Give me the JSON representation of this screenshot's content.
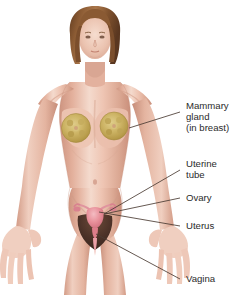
{
  "figure": {
    "background_color": "#ffffff",
    "width": 236,
    "height": 295,
    "text_color": "#2b2b2b",
    "leader_line_color": "#4a3b33"
  },
  "labels": [
    {
      "name": "mammary-gland",
      "lines": [
        "Mammary",
        "gland",
        "(in breast)"
      ],
      "text_x": 186,
      "text_y": 100,
      "leader": {
        "x1": 180,
        "y1": 112,
        "x2": 129,
        "y2": 128
      }
    },
    {
      "name": "uterine-tube",
      "lines": [
        "Uterine",
        "tube"
      ],
      "text_x": 186,
      "text_y": 158,
      "leader": {
        "x1": 180,
        "y1": 170,
        "x2": 104,
        "y2": 214
      }
    },
    {
      "name": "ovary",
      "lines": [
        "Ovary"
      ],
      "text_x": 186,
      "text_y": 194,
      "leader": {
        "x1": 180,
        "y1": 198,
        "x2": 104,
        "y2": 214
      }
    },
    {
      "name": "uterus",
      "lines": [
        "Uterus"
      ],
      "text_x": 186,
      "text_y": 222,
      "leader": {
        "x1": 180,
        "y1": 226,
        "x2": 99,
        "y2": 212
      }
    },
    {
      "name": "vagina",
      "lines": [
        "Vagina"
      ],
      "text_x": 186,
      "text_y": 275,
      "leader": {
        "x1": 180,
        "y1": 279,
        "x2": 96,
        "y2": 234
      }
    }
  ],
  "anatomy": {
    "skin": {
      "base": "#e9bca9",
      "light": "#f3d6c8",
      "mid": "#e0ac97",
      "shadow": "#cd9480",
      "deep_shadow": "#bf8370",
      "highlight": "#f8e6dc"
    },
    "hair": {
      "base": "#8a5a33",
      "dark": "#5f3a1f",
      "light": "#b07e4c"
    },
    "mammary_gland": {
      "fill": "#cdb465",
      "lobule": "#b79b4a",
      "rim": "#a98f43",
      "label": "mammary gland lobules"
    },
    "uterus": {
      "fill": "#e8909a",
      "dark": "#cf6e7c",
      "light": "#f2b3ba",
      "label": "uterus"
    },
    "ovary": {
      "fill": "#d9828f",
      "label": "ovary"
    },
    "uterine_tube": {
      "fill": "#e0949f",
      "label": "uterine tube"
    },
    "vagina": {
      "fill": "#eaa0a8",
      "label": "vaginal canal"
    },
    "pubic_region": {
      "fill": "#53382c",
      "dark": "#3b2720",
      "label": "pubic region"
    },
    "nipple": "#c98a78"
  }
}
